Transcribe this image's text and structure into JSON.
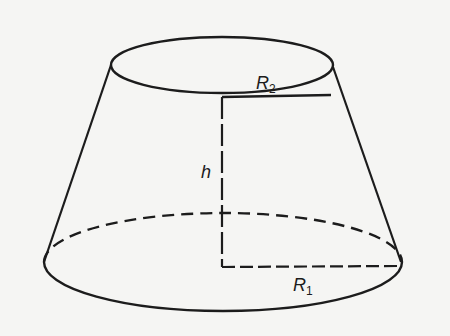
{
  "diagram": {
    "labels": {
      "top_radius": {
        "base": "R",
        "sub": "2"
      },
      "bottom_radius": {
        "base": "R",
        "sub": "1"
      },
      "height": "h"
    },
    "colors": {
      "background": "#f5f5f3",
      "stroke": "#1c1c1c"
    },
    "geometry": {
      "top_ellipse": {
        "cx": 222,
        "cy": 65,
        "rx": 111,
        "ry": 28
      },
      "bottom_ellipse": {
        "cx": 223,
        "cy": 262,
        "rx": 179,
        "ry": 49
      },
      "axis_x": 222,
      "top_radius_y": 97,
      "bottom_radius_y": 267
    }
  }
}
